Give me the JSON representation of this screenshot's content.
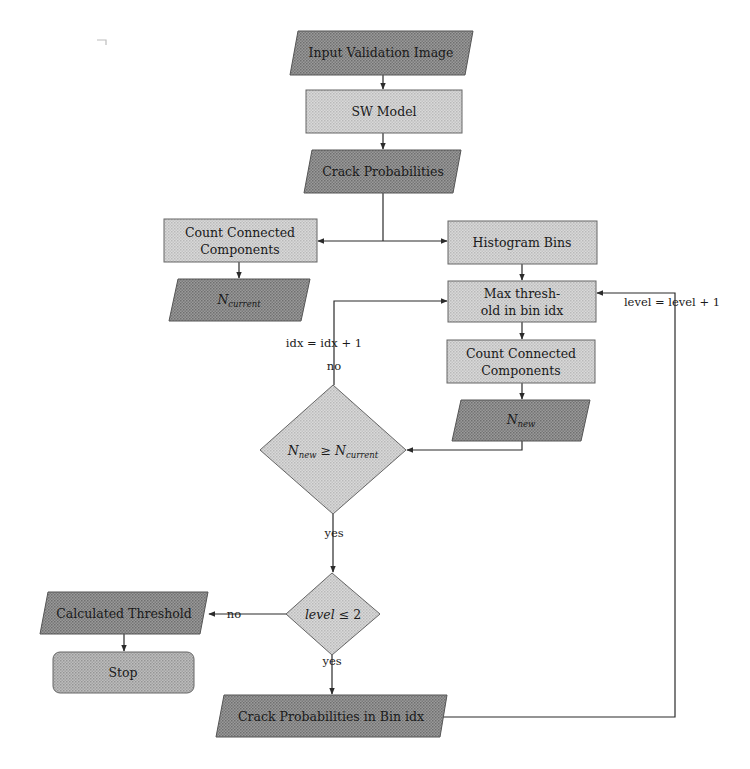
{
  "diagram": {
    "type": "flowchart",
    "colors": {
      "background": "#ffffff",
      "io_fill": "#8e8e8e",
      "process_fill": "#cfcfcf",
      "decision_fill": "#c8c8c8",
      "terminal_fill": "#a9a9a9",
      "stroke": "#2b2b2b"
    },
    "nodes": {
      "input_image": {
        "shape": "parallelogram",
        "label": "Input Validation Image"
      },
      "sw_model": {
        "shape": "rectangle",
        "label": "SW Model"
      },
      "crack_prob": {
        "shape": "parallelogram",
        "label": "Crack Probabilities"
      },
      "count_cc_left": {
        "shape": "rectangle",
        "label_line1": "Count Connected",
        "label_line2": "Components"
      },
      "n_current": {
        "shape": "parallelogram",
        "label_main": "N",
        "label_sub": "current"
      },
      "hist_bins": {
        "shape": "rectangle",
        "label": "Histogram Bins"
      },
      "max_thresh": {
        "shape": "rectangle",
        "label_line1": "Max thresh-",
        "label_line2": "old in bin idx"
      },
      "count_cc_right": {
        "shape": "rectangle",
        "label_line1": "Count Connected",
        "label_line2": "Components"
      },
      "n_new": {
        "shape": "parallelogram",
        "label_main": "N",
        "label_sub": "new"
      },
      "decision_compare": {
        "shape": "diamond",
        "lhs_main": "N",
        "lhs_sub": "new",
        "op": " ≥ ",
        "rhs_main": "N",
        "rhs_sub": "current"
      },
      "decision_level": {
        "shape": "diamond",
        "lhs": "level",
        "op": " ≤ 2"
      },
      "calc_threshold": {
        "shape": "parallelogram",
        "label": "Calculated Threshold"
      },
      "stop": {
        "shape": "rounded-rectangle",
        "label": "Stop"
      },
      "crack_prob_bin": {
        "shape": "parallelogram",
        "label": "Crack Probabilities in Bin idx"
      }
    },
    "edge_labels": {
      "idx_increment": "idx = idx + 1",
      "no_compare": "no",
      "yes_compare": "yes",
      "no_level": "no",
      "yes_level": "yes",
      "level_increment": "level = level + 1"
    }
  }
}
